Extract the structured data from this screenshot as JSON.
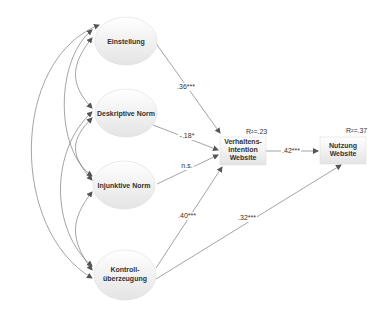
{
  "diagram": {
    "type": "path-model",
    "nodes": {
      "einstellung": {
        "label": "Einstellung"
      },
      "deskriptive_norm": {
        "label": "Deskriptive Norm"
      },
      "injunktive_norm": {
        "label": "Injunktive Norm"
      },
      "kontroll": {
        "line1": "Kontroll-",
        "line2": "überzeugung"
      },
      "intention": {
        "line1": "Verhaltens-",
        "line2": "intention",
        "line3": "Website",
        "r2": "R²=.23"
      },
      "nutzung": {
        "line1": "Nutzung",
        "line2": "Website",
        "r2": "R²=.37"
      }
    },
    "paths": {
      "einstellung_intention": ".36***",
      "deskriptive_intention": "-.18*",
      "injunktive_intention": "n.s.",
      "kontroll_intention": ".40***",
      "kontroll_nutzung": ".32***",
      "intention_nutzung": ".42***"
    },
    "colors": {
      "line": "#555555",
      "node_fill_top": "#ffffff",
      "node_fill_bottom": "#e6e6e6",
      "node_stroke": "#cccccc"
    }
  }
}
